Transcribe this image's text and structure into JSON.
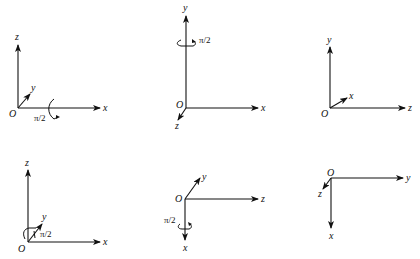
{
  "figure": {
    "diagrams": [
      {
        "id": 1,
        "origin_label": "O",
        "axes": {
          "up": "z",
          "right": "x",
          "diagonal": "y"
        },
        "rotation": {
          "axis": "x",
          "angle_label": "π/2"
        }
      },
      {
        "id": 2,
        "origin_label": "O",
        "axes": {
          "up": "y",
          "right": "x",
          "diagonal": "z"
        },
        "rotation": {
          "axis": "y",
          "angle_label": "π/2"
        }
      },
      {
        "id": 3,
        "origin_label": "O",
        "axes": {
          "up": "y",
          "right": "z",
          "diagonal": "x"
        }
      },
      {
        "id": 4,
        "origin_label": "O",
        "axes": {
          "up": "z",
          "right": "x",
          "diagonal": "y"
        },
        "rotation": {
          "axis": "y",
          "angle_label": "π/2"
        }
      },
      {
        "id": 5,
        "origin_label": "O",
        "axes": {
          "down": "x",
          "right": "z",
          "diagonal": "y"
        },
        "rotation": {
          "axis": "x",
          "angle_label": "π/2"
        }
      },
      {
        "id": 6,
        "origin_label": "O",
        "axes": {
          "down": "x",
          "right": "y",
          "diagonal": "z"
        }
      }
    ]
  }
}
